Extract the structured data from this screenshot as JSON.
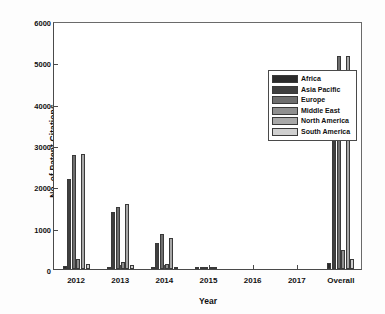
{
  "chart_data": {
    "type": "bar",
    "title": "",
    "xlabel": "Year",
    "ylabel": "No. of Patent Citations",
    "categories": [
      "2012",
      "2013",
      "2014",
      "2015",
      "2016",
      "2017",
      "Overall"
    ],
    "ylim": [
      0,
      6000
    ],
    "yticks": [
      0,
      1000,
      2000,
      3000,
      4000,
      5000,
      6000
    ],
    "ytick_labels": [
      "0",
      "1000",
      "2000",
      "3000",
      "4000",
      "5000",
      "6000"
    ],
    "grid": false,
    "legend_position": "upper center-right",
    "series": [
      {
        "name": "Africa",
        "color": "#2b2b2b",
        "values": [
          70,
          40,
          30,
          25,
          0,
          0,
          140
        ]
      },
      {
        "name": "Asia Pacific",
        "color": "#3f3f3f",
        "values": [
          2180,
          1390,
          620,
          55,
          0,
          0,
          4250
        ]
      },
      {
        "name": "Europe",
        "color": "#6e6e6e",
        "values": [
          2750,
          1500,
          840,
          60,
          0,
          0,
          5150
        ]
      },
      {
        "name": "Middle East",
        "color": "#8f8f8f",
        "values": [
          250,
          170,
          110,
          10,
          0,
          0,
          460
        ]
      },
      {
        "name": "North America",
        "color": "#a8a8a8",
        "values": [
          2790,
          1580,
          740,
          35,
          0,
          0,
          5150
        ]
      },
      {
        "name": "South America",
        "color": "#cfcfcf",
        "values": [
          120,
          90,
          40,
          0,
          0,
          0,
          240
        ]
      }
    ]
  },
  "legend": {
    "items": [
      {
        "label": "Africa"
      },
      {
        "label": "Asia Pacific"
      },
      {
        "label": "Europe"
      },
      {
        "label": "Middle East"
      },
      {
        "label": "North America"
      },
      {
        "label": "South America"
      }
    ]
  }
}
